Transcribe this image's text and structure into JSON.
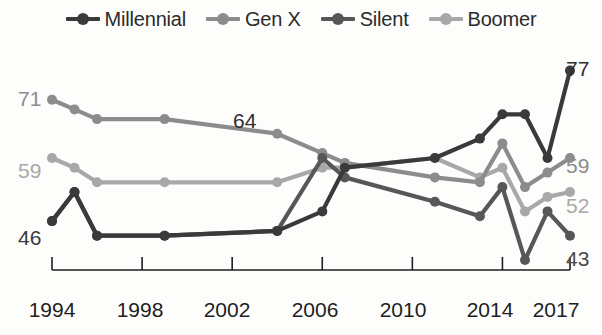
{
  "legend": {
    "items": [
      {
        "label": "Millennial",
        "color": "#3a3a3a",
        "icon": "line-dot-marker"
      },
      {
        "label": "Gen X",
        "color": "#8c8c8c",
        "icon": "line-dot-marker"
      },
      {
        "label": "Silent",
        "color": "#575757",
        "icon": "line-dot-marker"
      },
      {
        "label": "Boomer",
        "color": "#a8a8a8",
        "icon": "line-dot-marker"
      }
    ]
  },
  "axis": {
    "x_ticks": [
      "1994",
      "1998",
      "2002",
      "2006",
      "2010",
      "2014",
      "2017"
    ],
    "x_tick_years": [
      1994,
      1998,
      2002,
      2006,
      2010,
      2014,
      2017
    ],
    "axis_color": "#1e1e1e"
  },
  "annotations": {
    "left": [
      {
        "text": "71",
        "series": "Gen X",
        "color": "#8c8c8c",
        "x": 18,
        "y": 88
      },
      {
        "text": "59",
        "series": "Boomer",
        "color": "#a8a8a8",
        "x": 18,
        "y": 160
      },
      {
        "text": "46",
        "series": "Millennial",
        "color": "#3a3a3a",
        "x": 18,
        "y": 227
      }
    ],
    "right": [
      {
        "text": "77",
        "series": "Millennial",
        "color": "#2f2f2f",
        "x": 566,
        "y": 58
      },
      {
        "text": "59",
        "series": "Gen X",
        "color": "#8c8c8c",
        "x": 566,
        "y": 155
      },
      {
        "text": "52",
        "series": "Boomer",
        "color": "#a8a8a8",
        "x": 566,
        "y": 195
      },
      {
        "text": "43",
        "series": "Silent",
        "color": "#4a4a4a",
        "x": 566,
        "y": 248
      }
    ],
    "inline": [
      {
        "text": "64",
        "series": "Silent",
        "color": "#2f2f2f",
        "x": 233,
        "y": 110
      }
    ]
  },
  "chart_data": {
    "type": "line",
    "title": "",
    "xlabel": "",
    "ylabel": "",
    "xlim": [
      1994,
      2017
    ],
    "ylim": [
      38,
      80
    ],
    "grid": false,
    "legend_position": "top",
    "x": [
      1994,
      1995,
      1996,
      1999,
      2004,
      2006,
      2007,
      2011,
      2013,
      2014,
      2015,
      2016,
      2017
    ],
    "series": [
      {
        "name": "Millennial",
        "color": "#3a3a3a",
        "x": [
          1994,
          1995,
          1996,
          1999,
          2004,
          2006,
          2007,
          2011,
          2013,
          2014,
          2015,
          2016,
          2017
        ],
        "values": [
          46,
          52,
          43,
          43,
          44,
          48,
          57,
          59,
          63,
          68,
          68,
          59,
          77
        ],
        "start_label": 46,
        "end_label": 77
      },
      {
        "name": "Gen X",
        "color": "#8c8c8c",
        "x": [
          1994,
          1995,
          1996,
          1999,
          2004,
          2006,
          2007,
          2011,
          2013,
          2014,
          2015,
          2016,
          2017
        ],
        "values": [
          71,
          69,
          67,
          67,
          64,
          60,
          58,
          55,
          54,
          62,
          53,
          56,
          59
        ],
        "start_label": 71,
        "end_label": 59
      },
      {
        "name": "Silent",
        "color": "#575757",
        "x": [
          1994,
          1995,
          1996,
          1999,
          2004,
          2006,
          2007,
          2011,
          2013,
          2014,
          2015,
          2016,
          2017
        ],
        "values": [
          46,
          52,
          43,
          43,
          44,
          59,
          55,
          50,
          47,
          53,
          38,
          48,
          43
        ],
        "inline_label": 64,
        "end_label": 43
      },
      {
        "name": "Boomer",
        "color": "#a8a8a8",
        "x": [
          1994,
          1995,
          1996,
          1999,
          2004,
          2006,
          2007,
          2011,
          2013,
          2014,
          2015,
          2016,
          2017
        ],
        "values": [
          59,
          57,
          54,
          54,
          54,
          57,
          57,
          59,
          55,
          57,
          48,
          51,
          52
        ],
        "start_label": 59,
        "end_label": 52
      }
    ]
  }
}
